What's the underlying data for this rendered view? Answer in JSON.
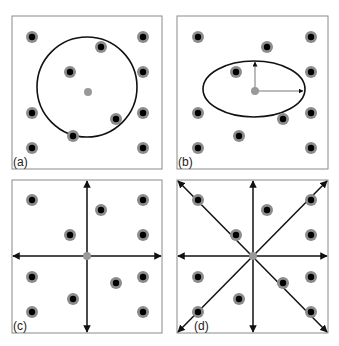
{
  "figure": {
    "background": "#ffffff",
    "colors": {
      "frame": "#8a8a8a",
      "dot_halo": "#8c8c8c",
      "dot_core": "#000000",
      "query_point": "#999999",
      "shape_stroke": "#111111",
      "arrow_gray": "#777777"
    },
    "panels": [
      {
        "id": "a",
        "label": "(a)",
        "description": "circular neighborhood",
        "box": {
          "x": 12,
          "y": 16,
          "w": 150,
          "h": 153
        },
        "center": {
          "x": 88,
          "y": 92
        },
        "circle": {
          "cx": 87,
          "cy": 87,
          "r": 50
        },
        "points": [
          [
            32,
            37
          ],
          [
            101,
            47
          ],
          [
            143,
            37
          ],
          [
            70,
            72
          ],
          [
            143,
            72
          ],
          [
            32,
            113
          ],
          [
            116,
            119
          ],
          [
            143,
            113
          ],
          [
            73,
            136
          ],
          [
            32,
            148
          ],
          [
            143,
            148
          ]
        ]
      },
      {
        "id": "b",
        "label": "(b)",
        "description": "elliptical neighborhood with axes",
        "box": {
          "x": 177,
          "y": 16,
          "w": 151,
          "h": 153
        },
        "center": {
          "x": 255,
          "y": 91
        },
        "ellipse": {
          "cx": 254,
          "cy": 89,
          "rx": 51,
          "ry": 28
        },
        "axis_arrows": [
          {
            "x2": 256,
            "y2": 61
          },
          {
            "x2": 304,
            "y2": 91
          }
        ],
        "points": [
          [
            198,
            37
          ],
          [
            267,
            47
          ],
          [
            311,
            37
          ],
          [
            236,
            72
          ],
          [
            311,
            72
          ],
          [
            198,
            113
          ],
          [
            283,
            119
          ],
          [
            311,
            113
          ],
          [
            239,
            136
          ],
          [
            198,
            148
          ],
          [
            311,
            148
          ]
        ]
      },
      {
        "id": "c",
        "label": "(c)",
        "description": "quadrant sectors",
        "box": {
          "x": 12,
          "y": 180,
          "w": 150,
          "h": 153
        },
        "center": {
          "x": 87,
          "y": 256
        },
        "points": [
          [
            32,
            200
          ],
          [
            101,
            210
          ],
          [
            143,
            200
          ],
          [
            70,
            235
          ],
          [
            143,
            235
          ],
          [
            32,
            277
          ],
          [
            116,
            283
          ],
          [
            143,
            277
          ],
          [
            73,
            299
          ],
          [
            32,
            312
          ],
          [
            143,
            312
          ]
        ]
      },
      {
        "id": "d",
        "label": "(d)",
        "description": "octant sectors",
        "box": {
          "x": 177,
          "y": 180,
          "w": 151,
          "h": 153
        },
        "center": {
          "x": 253,
          "y": 256
        },
        "points": [
          [
            198,
            200
          ],
          [
            267,
            210
          ],
          [
            311,
            200
          ],
          [
            236,
            235
          ],
          [
            311,
            235
          ],
          [
            198,
            277
          ],
          [
            283,
            283
          ],
          [
            311,
            277
          ],
          [
            239,
            299
          ],
          [
            198,
            312
          ],
          [
            311,
            312
          ]
        ]
      }
    ]
  }
}
